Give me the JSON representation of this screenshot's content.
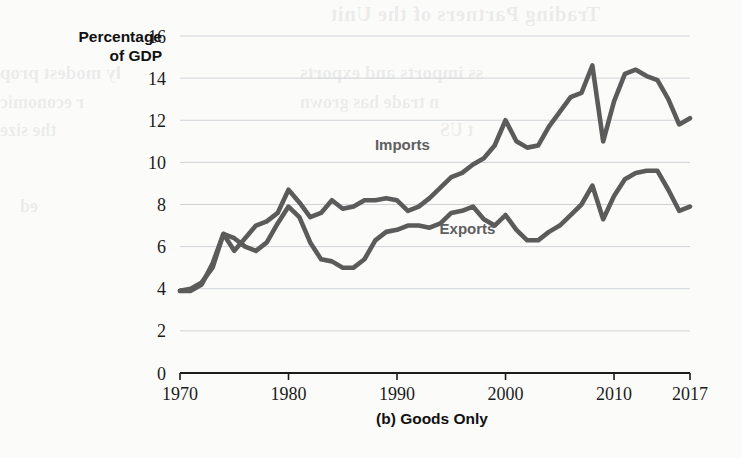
{
  "figure": {
    "caption": "(b) Goods Only",
    "y_axis_title_line1": "Percentage",
    "y_axis_title_line2": "of GDP"
  },
  "colors": {
    "line": "#5b5b5b",
    "grid": "#cfd3d6",
    "axis": "#1b1b1b",
    "label": "#5f5f5f",
    "background": "#fbfbfa"
  },
  "bleed_through_text": {
    "b1": "Trading Partners of the Unit",
    "b2": "ss imports and exports",
    "b3": "n trade has grown",
    "b4": "ly modest prop",
    "b5": "r economic",
    "b6": "the size",
    "b7": "t US",
    "b8": "ed"
  },
  "chart_data": {
    "type": "line",
    "title": "(b) Goods Only",
    "xlabel": "",
    "ylabel": "Percentage of GDP",
    "xlim": [
      1970,
      2017
    ],
    "ylim": [
      0,
      16
    ],
    "ytick_labels": [
      "0",
      "2",
      "4",
      "6",
      "8",
      "10",
      "12",
      "14",
      "16"
    ],
    "ytick_values": [
      0,
      2,
      4,
      6,
      8,
      10,
      12,
      14,
      16
    ],
    "xtick_labels": [
      "1970",
      "1980",
      "1990",
      "2000",
      "2010",
      "2017"
    ],
    "xtick_values": [
      1970,
      1980,
      1990,
      2000,
      2010,
      2017
    ],
    "grid": true,
    "legend": "inline-annotations",
    "annotations": [
      {
        "text": "Imports",
        "x": 1990.5,
        "y": 10.6
      },
      {
        "text": "Exports",
        "x": 1996.5,
        "y": 6.6
      }
    ],
    "x": [
      1970,
      1971,
      1972,
      1973,
      1974,
      1975,
      1976,
      1977,
      1978,
      1979,
      1980,
      1981,
      1982,
      1983,
      1984,
      1985,
      1986,
      1987,
      1988,
      1989,
      1990,
      1991,
      1992,
      1993,
      1994,
      1995,
      1996,
      1997,
      1998,
      1999,
      2000,
      2001,
      2002,
      2003,
      2004,
      2005,
      2006,
      2007,
      2008,
      2009,
      2010,
      2011,
      2012,
      2013,
      2014,
      2015,
      2016,
      2017
    ],
    "series": [
      {
        "name": "Imports",
        "values": [
          3.9,
          4.0,
          4.3,
          5.0,
          6.6,
          5.8,
          6.4,
          7.0,
          7.2,
          7.6,
          8.7,
          8.1,
          7.4,
          7.6,
          8.2,
          7.8,
          7.9,
          8.2,
          8.2,
          8.3,
          8.2,
          7.7,
          7.9,
          8.3,
          8.8,
          9.3,
          9.5,
          9.9,
          10.2,
          10.8,
          12.0,
          11.0,
          10.7,
          10.8,
          11.7,
          12.4,
          13.1,
          13.3,
          14.6,
          11.0,
          12.9,
          14.2,
          14.4,
          14.1,
          13.9,
          13.0,
          11.8,
          12.1
        ]
      },
      {
        "name": "Exports",
        "values": [
          3.9,
          3.9,
          4.2,
          5.2,
          6.6,
          6.4,
          6.0,
          5.8,
          6.2,
          7.1,
          7.9,
          7.4,
          6.2,
          5.4,
          5.3,
          5.0,
          5.0,
          5.4,
          6.3,
          6.7,
          6.8,
          7.0,
          7.0,
          6.9,
          7.1,
          7.6,
          7.7,
          7.9,
          7.3,
          7.0,
          7.5,
          6.8,
          6.3,
          6.3,
          6.7,
          7.0,
          7.5,
          8.0,
          8.9,
          7.3,
          8.4,
          9.2,
          9.5,
          9.6,
          9.6,
          8.7,
          7.7,
          7.9
        ]
      }
    ]
  },
  "geometry": {
    "plot_left": 180,
    "plot_right": 690,
    "plot_top": 36,
    "plot_bottom": 373
  }
}
